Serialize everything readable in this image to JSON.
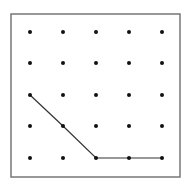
{
  "diagram": {
    "type": "geoboard-dot-grid",
    "grid": {
      "cols": 5,
      "rows": 5
    },
    "frame": {
      "x": 11,
      "y": 14,
      "width": 169,
      "height": 163,
      "stroke": "#777777"
    },
    "dot_x": [
      30,
      63,
      96,
      129,
      162
    ],
    "dot_y": [
      32,
      63,
      95,
      126,
      158
    ],
    "dot_color": "#111111",
    "path": [
      [
        0,
        2
      ],
      [
        1,
        3
      ],
      [
        2,
        4
      ],
      [
        3,
        4
      ],
      [
        4,
        4
      ]
    ],
    "path_color": "#333333"
  }
}
